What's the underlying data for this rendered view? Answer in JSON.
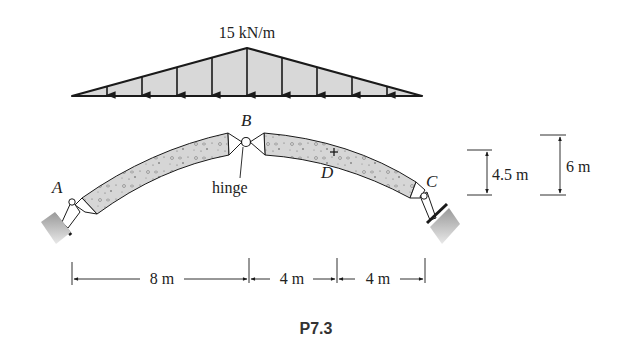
{
  "figure": {
    "caption": "P7.3"
  },
  "load": {
    "label": "15 kN/m",
    "shape": "triangular",
    "peak_value_kN_per_m": 15,
    "arrow_count": 9
  },
  "points": {
    "A": "A",
    "B": "B",
    "C": "C",
    "D": "D"
  },
  "annotations": {
    "hinge": "hinge"
  },
  "dimensions": {
    "horizontal": [
      {
        "label": "8 m",
        "value_m": 8
      },
      {
        "label": "4 m",
        "value_m": 4
      },
      {
        "label": "4 m",
        "value_m": 4
      }
    ],
    "vertical": [
      {
        "label": "4.5 m",
        "value_m": 4.5
      },
      {
        "label": "6 m",
        "value_m": 6
      }
    ]
  },
  "colors": {
    "load_fill": "#d8d8d8",
    "arch_fill": "#d4d4d4",
    "stroke": "#1a1a1a",
    "ground": "#bdbdbd"
  }
}
